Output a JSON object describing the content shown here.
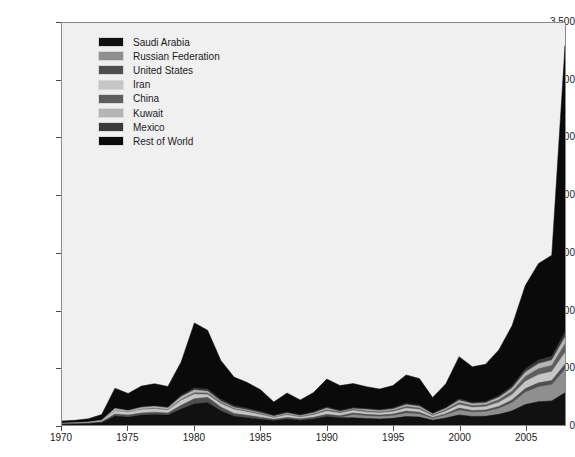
{
  "chart_data": {
    "type": "area",
    "stacked": true,
    "title": "",
    "subtitle": "",
    "xlabel": "",
    "ylabel": "Value of rent from oil production (billion USD)",
    "xlim": [
      1970,
      2008
    ],
    "ylim": [
      0,
      3500
    ],
    "grid": false,
    "legend_position": "top-left",
    "x_ticks": [
      1970,
      1975,
      1980,
      1985,
      1990,
      1995,
      2000,
      2005
    ],
    "x_tick_labels": [
      "1970",
      "1975",
      "1980",
      "1985",
      "1990",
      "1995",
      "2000",
      "2005"
    ],
    "y_ticks": [
      0,
      500,
      1000,
      1500,
      2000,
      2500,
      3000,
      3500
    ],
    "y_tick_labels": [
      "0",
      "500",
      "1,000",
      "1,500",
      "2,000",
      "2,500",
      "3,000",
      "3,500"
    ],
    "x": [
      1970,
      1971,
      1972,
      1973,
      1974,
      1975,
      1976,
      1977,
      1978,
      1979,
      1980,
      1981,
      1982,
      1983,
      1984,
      1985,
      1986,
      1987,
      1988,
      1989,
      1990,
      1991,
      1992,
      1993,
      1994,
      1995,
      1996,
      1997,
      1998,
      1999,
      2000,
      2001,
      2002,
      2003,
      2004,
      2005,
      2006,
      2007,
      2008
    ],
    "series": [
      {
        "name": "Saudi Arabia",
        "color": "#111111",
        "values": [
          7,
          9,
          13,
          22,
          78,
          70,
          86,
          92,
          86,
          140,
          186,
          196,
          125,
          77,
          64,
          50,
          40,
          52,
          42,
          52,
          73,
          64,
          63,
          57,
          52,
          58,
          74,
          69,
          42,
          61,
          88,
          75,
          76,
          93,
          123,
          178,
          203,
          210,
          280
        ]
      },
      {
        "name": "Russian Federation",
        "color": "#8f8f8f",
        "values": [
          0,
          0,
          0,
          0,
          0,
          0,
          0,
          0,
          0,
          0,
          0,
          0,
          0,
          0,
          0,
          0,
          0,
          0,
          0,
          0,
          0,
          0,
          26,
          22,
          21,
          23,
          29,
          26,
          15,
          25,
          40,
          36,
          39,
          50,
          71,
          107,
          128,
          141,
          203
        ]
      },
      {
        "name": "United States",
        "color": "#4f4f4f",
        "values": [
          4,
          4,
          4,
          6,
          18,
          17,
          19,
          20,
          19,
          32,
          43,
          45,
          32,
          23,
          21,
          17,
          11,
          14,
          12,
          15,
          20,
          17,
          16,
          14,
          13,
          14,
          18,
          16,
          9,
          13,
          19,
          16,
          16,
          19,
          24,
          32,
          36,
          36,
          46
        ]
      },
      {
        "name": "Iran",
        "color": "#c6c6c6",
        "values": [
          2,
          3,
          4,
          7,
          26,
          22,
          27,
          28,
          24,
          41,
          38,
          23,
          29,
          34,
          28,
          22,
          13,
          20,
          13,
          20,
          27,
          22,
          21,
          19,
          18,
          20,
          25,
          23,
          13,
          20,
          29,
          25,
          27,
          34,
          45,
          62,
          71,
          76,
          101
        ]
      },
      {
        "name": "China",
        "color": "#5e5e5e",
        "values": [
          0,
          1,
          1,
          1,
          3,
          3,
          5,
          6,
          6,
          10,
          14,
          14,
          11,
          9,
          9,
          8,
          6,
          8,
          7,
          9,
          12,
          11,
          11,
          10,
          10,
          11,
          15,
          14,
          8,
          13,
          20,
          17,
          18,
          23,
          31,
          44,
          52,
          56,
          75
        ]
      },
      {
        "name": "Kuwait",
        "color": "#b5b5b5",
        "values": [
          2,
          2,
          3,
          5,
          18,
          13,
          16,
          15,
          13,
          23,
          24,
          15,
          9,
          9,
          9,
          8,
          6,
          9,
          6,
          9,
          13,
          3,
          5,
          12,
          11,
          12,
          15,
          14,
          8,
          12,
          18,
          15,
          16,
          20,
          26,
          37,
          43,
          45,
          60
        ]
      },
      {
        "name": "Mexico",
        "color": "#3a3a3a",
        "values": [
          0,
          0,
          0,
          1,
          2,
          2,
          3,
          5,
          7,
          12,
          18,
          21,
          18,
          15,
          14,
          12,
          7,
          9,
          8,
          9,
          12,
          10,
          9,
          8,
          8,
          9,
          12,
          11,
          6,
          9,
          14,
          12,
          12,
          15,
          20,
          28,
          33,
          34,
          44
        ]
      },
      {
        "name": "Rest of World",
        "color": "#0a0a0a",
        "values": [
          20,
          22,
          30,
          49,
          175,
          148,
          183,
          193,
          181,
          291,
          566,
          511,
          338,
          250,
          224,
          190,
          118,
          166,
          130,
          168,
          243,
          216,
          210,
          192,
          180,
          196,
          248,
          231,
          138,
          206,
          367,
          311,
          325,
          400,
          525,
          726,
          840,
          880,
          2494
        ]
      }
    ]
  },
  "legend": {
    "items": [
      {
        "label": "Saudi Arabia"
      },
      {
        "label": "Russian Federation"
      },
      {
        "label": "United States"
      },
      {
        "label": "Iran"
      },
      {
        "label": "China"
      },
      {
        "label": "Kuwait"
      },
      {
        "label": "Mexico"
      },
      {
        "label": "Rest of World"
      }
    ]
  }
}
